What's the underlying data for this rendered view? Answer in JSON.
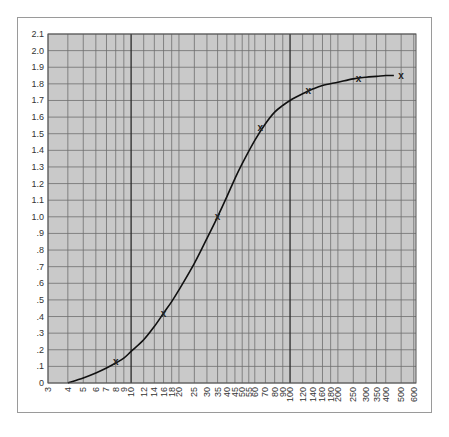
{
  "chart_data": {
    "type": "line",
    "title": "",
    "xlabel": "",
    "ylabel": "",
    "xscale": "log",
    "xlim": [
      3,
      620
    ],
    "ylim": [
      0,
      2.1
    ],
    "grid": true,
    "legend": null,
    "y_ticks": [
      "0",
      ".1",
      ".2",
      ".3",
      ".4",
      ".5",
      ".6",
      ".7",
      ".8",
      ".9",
      "1.0",
      "1.1",
      "1.2",
      "1.3",
      "1.4",
      "1.5",
      "1.6",
      "1.7",
      "1.8",
      "1.9",
      "2.0",
      "2.1"
    ],
    "x_ticks": [
      3,
      4,
      5,
      6,
      7,
      8,
      9,
      10,
      12,
      14,
      16,
      18,
      20,
      25,
      30,
      35,
      40,
      45,
      50,
      55,
      60,
      70,
      80,
      90,
      100,
      120,
      140,
      160,
      180,
      200,
      250,
      300,
      350,
      400,
      500,
      600
    ],
    "x_major_lines": [
      10,
      100
    ],
    "series": [
      {
        "name": "fitted curve",
        "style": "line",
        "x": [
          4,
          5,
          6,
          7,
          8,
          9,
          10,
          12,
          14,
          16,
          18,
          20,
          25,
          30,
          35,
          40,
          45,
          50,
          60,
          70,
          80,
          90,
          100,
          120,
          140,
          160,
          200,
          250,
          300,
          350,
          400,
          450
        ],
        "y": [
          0.0,
          0.03,
          0.06,
          0.09,
          0.12,
          0.15,
          0.19,
          0.26,
          0.34,
          0.42,
          0.49,
          0.56,
          0.72,
          0.87,
          1.0,
          1.12,
          1.23,
          1.32,
          1.46,
          1.56,
          1.63,
          1.67,
          1.7,
          1.74,
          1.77,
          1.79,
          1.81,
          1.83,
          1.84,
          1.845,
          1.85,
          1.85
        ]
      },
      {
        "name": "measured points",
        "style": "x-marker",
        "x": [
          8,
          16,
          35,
          65,
          130,
          270,
          500
        ],
        "y": [
          0.13,
          0.42,
          1.0,
          1.54,
          1.76,
          1.83,
          1.85
        ]
      }
    ],
    "colors": {
      "plot_bg": "#c9c9c9",
      "grid": "#6f6f6f",
      "major_grid": "#2a2a2a",
      "curve": "#111111",
      "marker": "#222222"
    }
  }
}
